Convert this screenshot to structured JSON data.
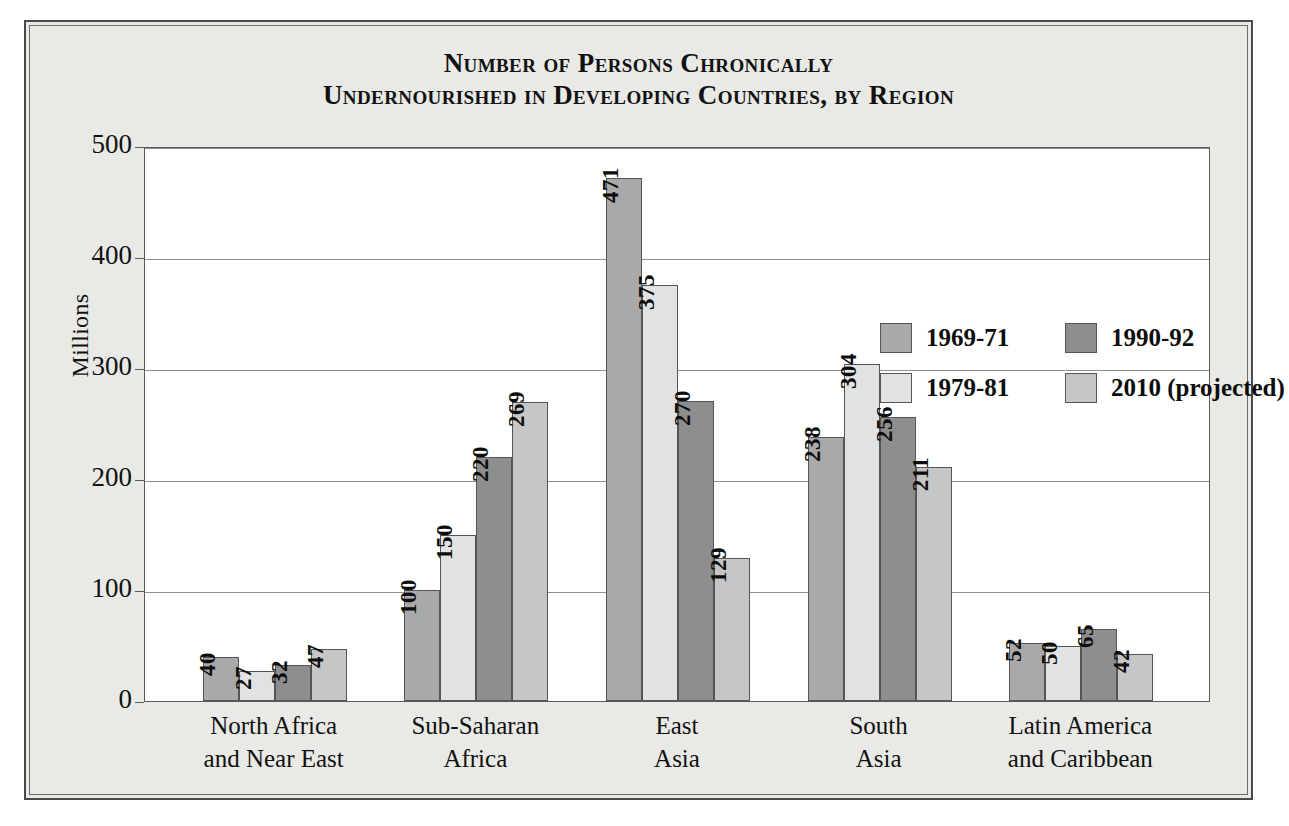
{
  "chart_data": {
    "type": "bar",
    "title": "Number of Persons Chronically Undernourished in Developing Countries, by Region",
    "title_lines": [
      "Number of Persons Chronically",
      "Undernourished in Developing Countries, by Region"
    ],
    "xlabel": "",
    "ylabel": "Millions",
    "ylim": [
      0,
      500
    ],
    "yticks": [
      0,
      100,
      200,
      300,
      400,
      500
    ],
    "ytick_labels": [
      "0",
      "100",
      "200",
      "300",
      "400",
      "500"
    ],
    "grid": true,
    "legend_position": "inside-upper-right",
    "categories": [
      "North Africa and Near East",
      "Sub-Saharan Africa",
      "East Asia",
      "South Asia",
      "Latin America and Caribbean"
    ],
    "category_lines": [
      [
        "North Africa",
        "and Near East"
      ],
      [
        "Sub-Saharan",
        "Africa"
      ],
      [
        "East",
        "Asia"
      ],
      [
        "South",
        "Asia"
      ],
      [
        "Latin America",
        "and Caribbean"
      ]
    ],
    "series": [
      {
        "name": "1969-71",
        "color": "#a9a9a9",
        "values": [
          40,
          100,
          471,
          238,
          52
        ]
      },
      {
        "name": "1979-81",
        "color": "#e2e2e2",
        "values": [
          27,
          150,
          375,
          304,
          50
        ]
      },
      {
        "name": "1990-92",
        "color": "#8e8e8e",
        "values": [
          32,
          220,
          270,
          256,
          65
        ]
      },
      {
        "name": "2010 (projected)",
        "color": "#c6c6c6",
        "values": [
          47,
          269,
          129,
          211,
          42
        ]
      }
    ],
    "legend_rows": [
      [
        {
          "label": "1969-71",
          "color": "#a9a9a9"
        },
        {
          "label": "1990-92",
          "color": "#8e8e8e"
        }
      ],
      [
        {
          "label": "1979-81",
          "color": "#e2e2e2"
        },
        {
          "label": "2010 (projected)",
          "color": "#c6c6c6"
        }
      ]
    ]
  },
  "colors": {
    "page_background": "#e9e9e6",
    "plot_background": "#ffffff",
    "frame_border": "#4a4a4a",
    "gridline": "#8d8d8d",
    "text": "#111111"
  }
}
